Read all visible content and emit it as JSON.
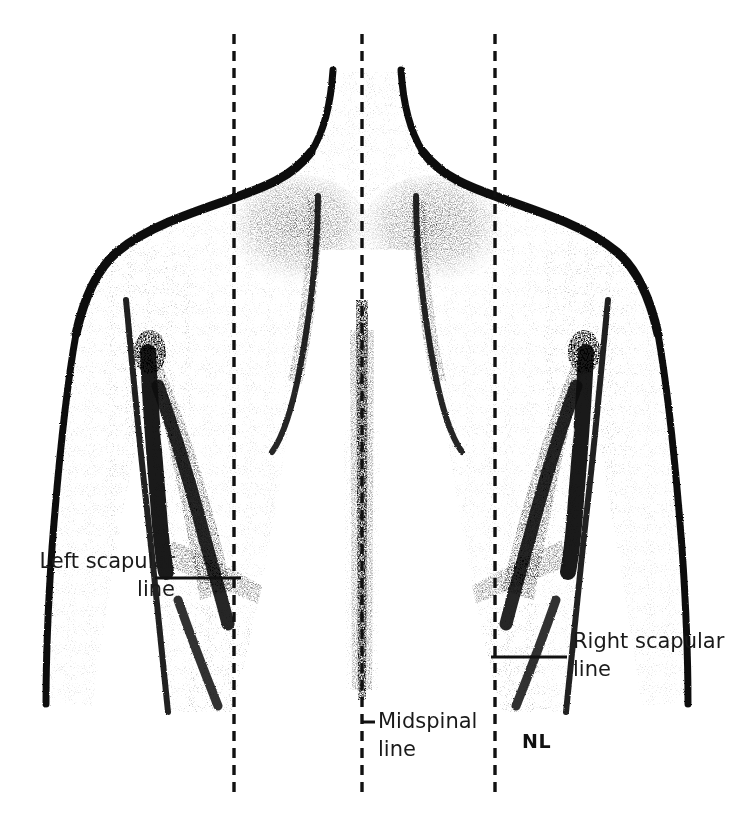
{
  "figure": {
    "background_color": "#ffffff",
    "ink_color": "#111111",
    "labels": [
      {
        "id": "left-scapular-line",
        "text_line1": "Left scapular",
        "text_line2": "line",
        "anchor": "end",
        "x": 175,
        "y1": 568,
        "y2": 596,
        "leader": {
          "x1": 155,
          "y1": 578,
          "x2": 241,
          "y2": 578
        }
      },
      {
        "id": "midspinal-line",
        "text_line1": "Midspinal",
        "text_line2": "line",
        "anchor": "start",
        "x": 378,
        "y1": 728,
        "y2": 756,
        "leader": {
          "x1": 362,
          "y1": 722,
          "x2": 375,
          "y2": 722
        }
      },
      {
        "id": "right-scapular-line",
        "text_line1": "Right scapular",
        "text_line2": "line",
        "anchor": "start",
        "x": 573,
        "y1": 648,
        "y2": 676,
        "leader": {
          "x1": 491,
          "y1": 657,
          "x2": 567,
          "y2": 657
        }
      }
    ],
    "annotation": {
      "id": "nl-marker",
      "text": "NL",
      "x": 522,
      "y": 748
    },
    "reference_lines": [
      {
        "id": "left-scapular-dashed",
        "x": 234,
        "y1": 34,
        "y2": 795
      },
      {
        "id": "midspinal-dashed",
        "x": 362,
        "y1": 34,
        "y2": 795
      },
      {
        "id": "right-scapular-dashed",
        "x": 495,
        "y1": 34,
        "y2": 795
      }
    ]
  }
}
